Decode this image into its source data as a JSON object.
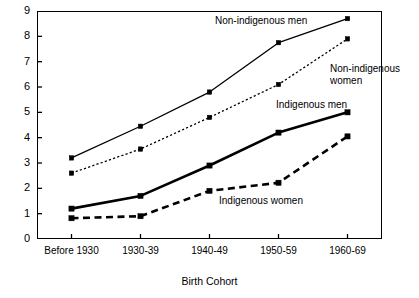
{
  "chart_data": {
    "type": "line",
    "title": "",
    "subtitle": "",
    "xlabel": "Birth Cohort",
    "ylabel": "",
    "categories": [
      "Before 1930",
      "1930-39",
      "1940-49",
      "1950-59",
      "1960-69"
    ],
    "xlim": [
      0,
      4
    ],
    "ylim": [
      0,
      9
    ],
    "yticks": [
      0,
      1,
      2,
      3,
      4,
      5,
      6,
      7,
      8,
      9
    ],
    "ytick_labels": [
      "0",
      "1",
      "2",
      "3",
      "4",
      "5",
      "6",
      "7",
      "8",
      "9"
    ],
    "grid": false,
    "legend": "inline-annotations",
    "series": [
      {
        "name": "Non-indigenous men",
        "values": [
          3.2,
          4.45,
          5.8,
          7.75,
          8.7
        ],
        "style": "solid",
        "linewidth": 1.3,
        "marker": "square",
        "color": "#000000"
      },
      {
        "name": "Non-indigenous women",
        "values": [
          2.6,
          3.55,
          4.8,
          6.1,
          7.9
        ],
        "style": "dotted",
        "linewidth": 1.3,
        "marker": "square",
        "color": "#000000"
      },
      {
        "name": "Indigenous men",
        "values": [
          1.2,
          1.7,
          2.9,
          4.2,
          5.0
        ],
        "style": "solid",
        "linewidth": 2.6,
        "marker": "square",
        "color": "#000000"
      },
      {
        "name": "Indigenous women",
        "values": [
          0.82,
          0.9,
          1.9,
          2.22,
          4.05
        ],
        "style": "dashed",
        "linewidth": 2.6,
        "marker": "square",
        "color": "#000000"
      }
    ],
    "annotations": [
      {
        "text": "Non-indigenous men",
        "x": 215,
        "y": 15,
        "series": "Non-indigenous men"
      },
      {
        "text": "Non-indigenous\nwomen",
        "x": 330,
        "y": 63,
        "series": "Non-indigenous women"
      },
      {
        "text": "Indigenous men",
        "x": 276,
        "y": 99,
        "series": "Indigenous men"
      },
      {
        "text": "Indigenous women",
        "x": 219,
        "y": 195,
        "series": "Indigenous women"
      }
    ]
  },
  "colors": {
    "axis": "#000000",
    "background": "#ffffff",
    "ink": "#000000"
  }
}
